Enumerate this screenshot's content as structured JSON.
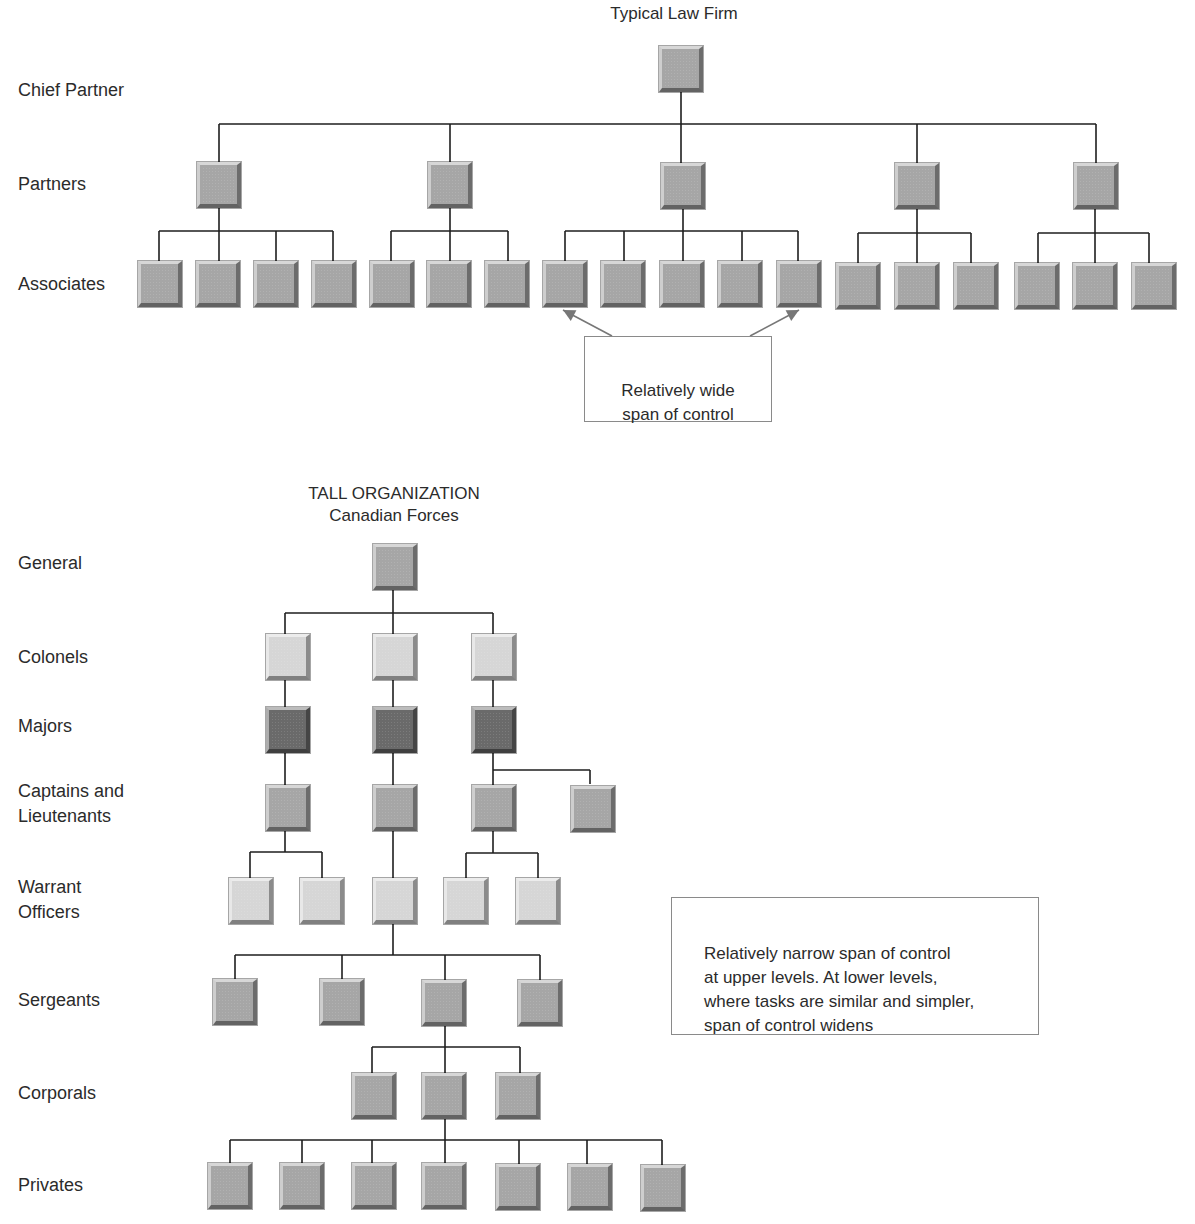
{
  "colors": {
    "mid": "#a6a6a6",
    "light": "#d6d6d6",
    "dark": "#6a6a6a",
    "line": "#1e1e1e",
    "arrow": "#777777"
  },
  "flat_org": {
    "title": "Typical Law Firm",
    "title_pos": {
      "x": 674,
      "y": 3
    },
    "levels": [
      {
        "label": "Chief Partner",
        "y": 78
      },
      {
        "label": "Partners",
        "y": 172
      },
      {
        "label": "Associates",
        "y": 272
      }
    ],
    "callout": {
      "text": "Relatively wide\nspan of control",
      "x": 584,
      "y": 336,
      "w": 188,
      "h": 86
    }
  },
  "tall_org": {
    "title": "TALL ORGANIZATION",
    "subtitle": "Canadian Forces",
    "title_pos": {
      "x": 394,
      "y": 483
    },
    "levels": [
      {
        "label": "General",
        "y": 551
      },
      {
        "label": "Colonels",
        "y": 645
      },
      {
        "label": "Majors",
        "y": 714
      },
      {
        "label": "Captains and\nLieutenants",
        "y": 779
      },
      {
        "label": "Warrant\nOfficers",
        "y": 875
      },
      {
        "label": "Sergeants",
        "y": 988
      },
      {
        "label": "Corporals",
        "y": 1081
      },
      {
        "label": "Privates",
        "y": 1173
      }
    ],
    "callout": {
      "text": "Relatively narrow span of control\nat upper levels. At lower levels,\nwhere tasks are similar and simpler,\nspan of control widens",
      "x": 671,
      "y": 897,
      "w": 368,
      "h": 138
    }
  },
  "nodes": [
    {
      "id": "cp",
      "x": 659,
      "y": 46,
      "c": "mid"
    },
    {
      "id": "p1",
      "x": 197,
      "y": 162,
      "c": "mid"
    },
    {
      "id": "p2",
      "x": 428,
      "y": 162,
      "c": "mid"
    },
    {
      "id": "p3",
      "x": 661,
      "y": 163,
      "c": "mid"
    },
    {
      "id": "p4",
      "x": 895,
      "y": 163,
      "c": "mid"
    },
    {
      "id": "p5",
      "x": 1074,
      "y": 163,
      "c": "mid"
    },
    {
      "id": "a1",
      "x": 138,
      "y": 261,
      "c": "mid"
    },
    {
      "id": "a2",
      "x": 196,
      "y": 261,
      "c": "mid"
    },
    {
      "id": "a3",
      "x": 254,
      "y": 261,
      "c": "mid"
    },
    {
      "id": "a4",
      "x": 312,
      "y": 261,
      "c": "mid"
    },
    {
      "id": "a5",
      "x": 370,
      "y": 261,
      "c": "mid"
    },
    {
      "id": "a6",
      "x": 427,
      "y": 261,
      "c": "mid"
    },
    {
      "id": "a7",
      "x": 485,
      "y": 261,
      "c": "mid"
    },
    {
      "id": "a8",
      "x": 543,
      "y": 261,
      "c": "mid"
    },
    {
      "id": "a9",
      "x": 601,
      "y": 261,
      "c": "mid"
    },
    {
      "id": "a10",
      "x": 660,
      "y": 261,
      "c": "mid"
    },
    {
      "id": "a11",
      "x": 718,
      "y": 261,
      "c": "mid"
    },
    {
      "id": "a12",
      "x": 777,
      "y": 261,
      "c": "mid"
    },
    {
      "id": "a13",
      "x": 836,
      "y": 263,
      "c": "mid"
    },
    {
      "id": "a14",
      "x": 895,
      "y": 263,
      "c": "mid"
    },
    {
      "id": "a15",
      "x": 954,
      "y": 263,
      "c": "mid"
    },
    {
      "id": "a16",
      "x": 1015,
      "y": 263,
      "c": "mid"
    },
    {
      "id": "a17",
      "x": 1073,
      "y": 263,
      "c": "mid"
    },
    {
      "id": "a18",
      "x": 1132,
      "y": 263,
      "c": "mid"
    },
    {
      "id": "g",
      "x": 373,
      "y": 544,
      "c": "mid"
    },
    {
      "id": "col1",
      "x": 266,
      "y": 634,
      "c": "light"
    },
    {
      "id": "col2",
      "x": 373,
      "y": 634,
      "c": "light"
    },
    {
      "id": "col3",
      "x": 472,
      "y": 634,
      "c": "light"
    },
    {
      "id": "maj1",
      "x": 266,
      "y": 707,
      "c": "dark"
    },
    {
      "id": "maj2",
      "x": 373,
      "y": 707,
      "c": "dark"
    },
    {
      "id": "maj3",
      "x": 472,
      "y": 707,
      "c": "dark"
    },
    {
      "id": "cap1",
      "x": 266,
      "y": 785,
      "c": "mid"
    },
    {
      "id": "cap2",
      "x": 373,
      "y": 785,
      "c": "mid"
    },
    {
      "id": "cap3",
      "x": 472,
      "y": 785,
      "c": "mid"
    },
    {
      "id": "cap4",
      "x": 571,
      "y": 786,
      "c": "mid"
    },
    {
      "id": "wo1",
      "x": 229,
      "y": 878,
      "c": "light"
    },
    {
      "id": "wo2",
      "x": 300,
      "y": 878,
      "c": "light"
    },
    {
      "id": "wo3",
      "x": 373,
      "y": 878,
      "c": "light"
    },
    {
      "id": "wo4",
      "x": 444,
      "y": 878,
      "c": "light"
    },
    {
      "id": "wo5",
      "x": 516,
      "y": 878,
      "c": "light"
    },
    {
      "id": "sg1",
      "x": 213,
      "y": 979,
      "c": "mid"
    },
    {
      "id": "sg2",
      "x": 320,
      "y": 979,
      "c": "mid"
    },
    {
      "id": "sg3",
      "x": 422,
      "y": 980,
      "c": "mid"
    },
    {
      "id": "sg4",
      "x": 518,
      "y": 980,
      "c": "mid"
    },
    {
      "id": "cp1",
      "x": 352,
      "y": 1073,
      "c": "mid"
    },
    {
      "id": "cp2",
      "x": 422,
      "y": 1073,
      "c": "mid"
    },
    {
      "id": "cp3",
      "x": 496,
      "y": 1073,
      "c": "mid"
    },
    {
      "id": "pv1",
      "x": 208,
      "y": 1163,
      "c": "mid"
    },
    {
      "id": "pv2",
      "x": 280,
      "y": 1163,
      "c": "mid"
    },
    {
      "id": "pv3",
      "x": 352,
      "y": 1163,
      "c": "mid"
    },
    {
      "id": "pv4",
      "x": 422,
      "y": 1163,
      "c": "mid"
    },
    {
      "id": "pv5",
      "x": 496,
      "y": 1164,
      "c": "mid"
    },
    {
      "id": "pv6",
      "x": 568,
      "y": 1164,
      "c": "mid"
    },
    {
      "id": "pv7",
      "x": 641,
      "y": 1165,
      "c": "mid"
    }
  ],
  "lines": [
    [
      681,
      92,
      681,
      124
    ],
    [
      219,
      124,
      1096,
      124
    ],
    [
      219,
      124,
      219,
      162
    ],
    [
      450,
      124,
      450,
      162
    ],
    [
      681,
      124,
      681,
      163
    ],
    [
      917,
      124,
      917,
      163
    ],
    [
      1096,
      124,
      1096,
      163
    ],
    [
      219,
      208,
      219,
      231
    ],
    [
      159,
      231,
      333,
      231
    ],
    [
      159,
      231,
      159,
      261
    ],
    [
      219,
      231,
      219,
      261
    ],
    [
      276,
      231,
      276,
      261
    ],
    [
      333,
      231,
      333,
      261
    ],
    [
      450,
      208,
      450,
      231
    ],
    [
      391,
      231,
      508,
      231
    ],
    [
      391,
      231,
      391,
      261
    ],
    [
      450,
      231,
      450,
      261
    ],
    [
      508,
      231,
      508,
      261
    ],
    [
      683,
      209,
      683,
      231
    ],
    [
      565,
      231,
      798,
      231
    ],
    [
      565,
      231,
      565,
      261
    ],
    [
      624,
      231,
      624,
      261
    ],
    [
      683,
      231,
      683,
      261
    ],
    [
      742,
      231,
      742,
      261
    ],
    [
      798,
      231,
      798,
      261
    ],
    [
      917,
      209,
      917,
      233
    ],
    [
      858,
      233,
      971,
      233
    ],
    [
      858,
      233,
      858,
      263
    ],
    [
      917,
      233,
      917,
      263
    ],
    [
      971,
      233,
      971,
      263
    ],
    [
      1095,
      209,
      1095,
      233
    ],
    [
      1038,
      233,
      1149,
      233
    ],
    [
      1038,
      233,
      1038,
      263
    ],
    [
      1095,
      233,
      1095,
      263
    ],
    [
      1149,
      233,
      1149,
      263
    ],
    [
      393,
      590,
      393,
      613
    ],
    [
      285,
      613,
      493,
      613
    ],
    [
      285,
      613,
      285,
      634
    ],
    [
      393,
      613,
      393,
      634
    ],
    [
      493,
      613,
      493,
      634
    ],
    [
      285,
      680,
      285,
      707
    ],
    [
      393,
      680,
      393,
      707
    ],
    [
      493,
      680,
      493,
      707
    ],
    [
      285,
      753,
      285,
      785
    ],
    [
      393,
      753,
      393,
      785
    ],
    [
      493,
      753,
      493,
      785
    ],
    [
      493,
      770,
      590,
      770
    ],
    [
      590,
      770,
      590,
      784
    ],
    [
      285,
      831,
      285,
      852
    ],
    [
      250,
      852,
      322,
      852
    ],
    [
      250,
      852,
      250,
      878
    ],
    [
      322,
      852,
      322,
      878
    ],
    [
      393,
      831,
      393,
      878
    ],
    [
      493,
      831,
      493,
      853
    ],
    [
      466,
      853,
      538,
      853
    ],
    [
      466,
      853,
      466,
      878
    ],
    [
      538,
      853,
      538,
      878
    ],
    [
      393,
      924,
      393,
      955
    ],
    [
      235,
      955,
      540,
      955
    ],
    [
      235,
      955,
      235,
      979
    ],
    [
      342,
      955,
      342,
      979
    ],
    [
      445,
      955,
      445,
      980
    ],
    [
      540,
      955,
      540,
      980
    ],
    [
      445,
      1026,
      445,
      1047
    ],
    [
      372,
      1047,
      520,
      1047
    ],
    [
      372,
      1047,
      372,
      1073
    ],
    [
      445,
      1047,
      445,
      1073
    ],
    [
      520,
      1047,
      520,
      1073
    ],
    [
      445,
      1119,
      445,
      1140
    ],
    [
      230,
      1140,
      662,
      1140
    ],
    [
      230,
      1140,
      230,
      1163
    ],
    [
      302,
      1140,
      302,
      1163
    ],
    [
      372,
      1140,
      372,
      1163
    ],
    [
      445,
      1140,
      445,
      1163
    ],
    [
      519,
      1140,
      519,
      1164
    ],
    [
      587,
      1140,
      587,
      1164
    ],
    [
      662,
      1140,
      662,
      1165
    ]
  ],
  "arrows": [
    {
      "from": [
        612,
        336
      ],
      "to": [
        563,
        310
      ]
    },
    {
      "from": [
        750,
        336
      ],
      "to": [
        799,
        310
      ]
    }
  ]
}
